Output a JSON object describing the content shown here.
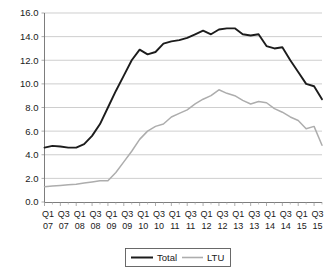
{
  "chart_data": {
    "type": "line",
    "title": "",
    "xlabel": "",
    "ylabel": "",
    "ylim": [
      0.0,
      16.0
    ],
    "ytick_step": 2.0,
    "grid": true,
    "legend_position": "bottom-center",
    "yticks": [
      "16.0",
      "14.0",
      "12.0",
      "10.0",
      "8.0",
      "6.0",
      "4.0",
      "2.0",
      "0.0"
    ],
    "ytick_values": [
      16.0,
      14.0,
      12.0,
      10.0,
      8.0,
      6.0,
      4.0,
      2.0,
      0.0
    ],
    "x_quarter_labels": [
      "Q1",
      "Q3",
      "Q1",
      "Q3",
      "Q1",
      "Q3",
      "Q1",
      "Q3",
      "Q1",
      "Q3",
      "Q1",
      "Q3",
      "Q1",
      "Q3",
      "Q1",
      "Q3",
      "Q1",
      "Q3"
    ],
    "x_year_labels": [
      "07",
      "07",
      "08",
      "08",
      "09",
      "09",
      "10",
      "10",
      "11",
      "11",
      "12",
      "12",
      "13",
      "13",
      "14",
      "14",
      "15",
      "15"
    ],
    "x_labeled_indices": [
      0,
      2,
      4,
      6,
      8,
      10,
      12,
      14,
      16,
      18,
      20,
      22,
      24,
      26,
      28,
      30,
      32,
      34
    ],
    "categories": [
      "Q1 07",
      "Q2 07",
      "Q3 07",
      "Q4 07",
      "Q1 08",
      "Q2 08",
      "Q3 08",
      "Q4 08",
      "Q1 09",
      "Q2 09",
      "Q3 09",
      "Q4 09",
      "Q1 10",
      "Q2 10",
      "Q3 10",
      "Q4 10",
      "Q1 11",
      "Q2 11",
      "Q3 11",
      "Q4 11",
      "Q1 12",
      "Q2 12",
      "Q3 12",
      "Q4 12",
      "Q1 13",
      "Q2 13",
      "Q3 13",
      "Q4 13",
      "Q1 14",
      "Q2 14",
      "Q3 14",
      "Q4 14",
      "Q1 15",
      "Q2 15",
      "Q3 15",
      "Q4 15"
    ],
    "series": [
      {
        "name": "Total",
        "color": "#1c1c1c",
        "values": [
          4.6,
          4.75,
          4.7,
          4.6,
          4.6,
          4.9,
          5.6,
          6.6,
          8.0,
          9.4,
          10.7,
          12.0,
          12.9,
          12.5,
          12.7,
          13.4,
          13.6,
          13.7,
          13.9,
          14.2,
          14.5,
          14.2,
          14.6,
          14.7,
          14.7,
          14.2,
          14.1,
          14.2,
          13.2,
          13.0,
          13.1,
          12.0,
          11.0,
          10.0,
          9.8,
          8.7
        ]
      },
      {
        "name": "LTU",
        "color": "#adadad",
        "values": [
          1.3,
          1.35,
          1.4,
          1.45,
          1.5,
          1.6,
          1.7,
          1.8,
          1.8,
          2.5,
          3.4,
          4.3,
          5.3,
          6.0,
          6.4,
          6.6,
          7.2,
          7.5,
          7.8,
          8.3,
          8.7,
          9.0,
          9.5,
          9.2,
          9.0,
          8.6,
          8.3,
          8.5,
          8.4,
          7.9,
          7.6,
          7.2,
          6.9,
          6.2,
          6.4,
          4.8
        ]
      }
    ],
    "legend": [
      {
        "label": "Total",
        "color": "#1c1c1c",
        "style": "thick-black-line"
      },
      {
        "label": "LTU",
        "color": "#adadad",
        "style": "thin-gray-line"
      }
    ]
  }
}
